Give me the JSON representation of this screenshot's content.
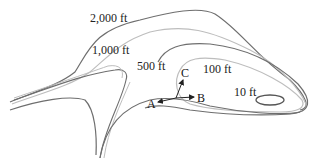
{
  "diagram": {
    "type": "topographic-contour-map",
    "colors": {
      "contour_dark": "#6e6e6e",
      "contour_light": "#bdbdbd",
      "vector": "#222222",
      "text": "#222222"
    },
    "contours": [
      {
        "label": "2,000 ft",
        "shade": "dark"
      },
      {
        "label": "1,000 ft",
        "shade": "light"
      },
      {
        "label": "500 ft",
        "shade": "dark"
      },
      {
        "label": "100 ft",
        "shade": "light"
      },
      {
        "label": "10 ft",
        "shade": "dark"
      }
    ],
    "vectors": [
      {
        "label": "A",
        "direction": "left"
      },
      {
        "label": "B",
        "direction": "right"
      },
      {
        "label": "C",
        "direction": "up"
      }
    ]
  }
}
